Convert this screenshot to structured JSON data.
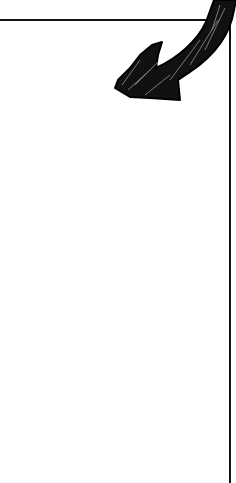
{
  "illustration": {
    "description": "hand-drawn scribbled arrow pointing down-left into a bordered box",
    "arrow_color": "#111111",
    "border_color": "#111111",
    "background": "#ffffff"
  }
}
